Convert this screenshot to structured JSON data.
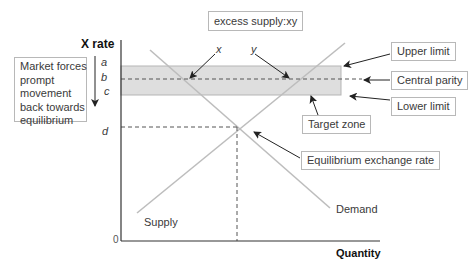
{
  "title_box": "excess supply:xy",
  "axes": {
    "y_label": "X rate",
    "x_label": "Quantity",
    "origin": "0"
  },
  "y_markers": [
    "a",
    "b",
    "c",
    "d"
  ],
  "point_labels": {
    "x": "x",
    "y": "y"
  },
  "curves": {
    "supply": "Supply",
    "demand": "Demand"
  },
  "side_note": {
    "lines": [
      "Market forces",
      "prompt",
      "movement",
      "back towards",
      "equilibrium"
    ]
  },
  "callouts": {
    "upper_limit": "Upper limit",
    "central_parity": "Central parity",
    "lower_limit": "Lower limit",
    "target_zone": "Target zone",
    "equilibrium": "Equilibrium exchange rate"
  },
  "colors": {
    "band_fill": "#dedede",
    "band_stroke": "#b5b5b5",
    "curve": "#bdbdbd",
    "axis": "#333333",
    "arrow": "#222222"
  }
}
